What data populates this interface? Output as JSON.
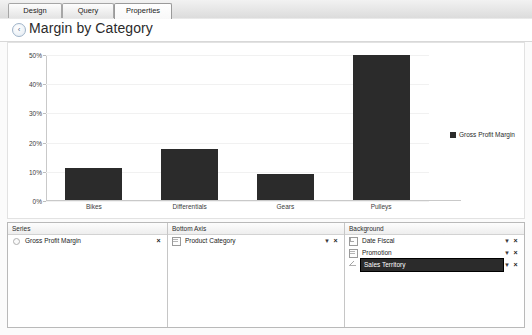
{
  "tabs": [
    {
      "label": "Design",
      "active": false
    },
    {
      "label": "Query",
      "active": false
    },
    {
      "label": "Properties",
      "active": true
    }
  ],
  "header": {
    "back_icon": "back-arrow-icon",
    "title": "Margin by Category"
  },
  "chart_data": {
    "type": "bar",
    "title": "Margin by Category",
    "categories": [
      "Bikes",
      "Differentials",
      "Gears",
      "Pulleys"
    ],
    "series": [
      {
        "name": "Gross Profit Margin",
        "values": [
          11,
          17.5,
          9,
          49.5
        ],
        "color": "#2b2b2b"
      }
    ],
    "ytick_labels": [
      "50%",
      "40%",
      "30%",
      "20%",
      "10%",
      "0%"
    ],
    "ytick_values": [
      50,
      40,
      30,
      20,
      10,
      0
    ],
    "ylim": [
      0,
      50
    ],
    "xlabel": "",
    "ylabel": "",
    "grid": true,
    "legend_position": "right",
    "legend": [
      "Gross Profit Margin"
    ]
  },
  "panels": {
    "series": {
      "header": "Series",
      "rows": [
        {
          "icon": "measure-icon",
          "label": "Gross Profit Margin",
          "has_dropdown": false,
          "remove": "×",
          "selected": false
        }
      ]
    },
    "bottom_axis": {
      "header": "Bottom Axis",
      "rows": [
        {
          "icon": "table-icon",
          "label": "Product Category",
          "has_dropdown": true,
          "dropdown": "▼",
          "remove": "×",
          "selected": false
        }
      ]
    },
    "background": {
      "header": "Background",
      "rows": [
        {
          "icon": "hierarchy-icon",
          "label": "Date Fiscal",
          "has_dropdown": true,
          "dropdown": "▼",
          "remove": "×",
          "selected": false
        },
        {
          "icon": "table-icon",
          "label": "Promotion",
          "has_dropdown": true,
          "dropdown": "▼",
          "remove": "×",
          "selected": false
        },
        {
          "icon": "geography-icon",
          "label": "Sales Territory",
          "has_dropdown": true,
          "dropdown": "▼",
          "remove": "×",
          "selected": true
        }
      ]
    }
  }
}
